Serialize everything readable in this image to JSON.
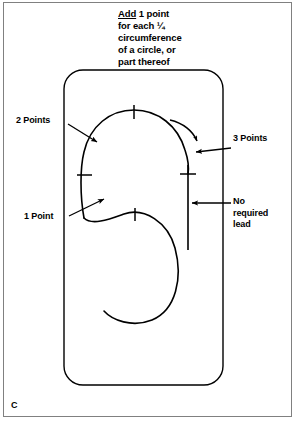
{
  "figure": {
    "panel_letter": "C",
    "note": {
      "line1_underlined": "Add",
      "line1_rest": " 1 point",
      "line2": "for each ¼",
      "line3": "circumference",
      "line4": "of a circle, or",
      "line5": "part thereof",
      "full_text": "Add 1 point for each ¼ circumference of a circle, or part thereof"
    },
    "labels": {
      "two_points": "2 Points",
      "one_point": "1 Point",
      "three_points": "3 Points",
      "no_required_lead": "No\nrequired\nlead"
    },
    "colors": {
      "ink": "#000000",
      "frame": "#808080",
      "background": "#ffffff"
    },
    "icons": {
      "direction_arrow": "curved-arrow-clockwise",
      "pointer_two_points": "arrow-down-right",
      "pointer_one_point": "arrow-up-right",
      "pointer_three_points": "arrow-left",
      "pointer_no_lead": "arrow-left"
    },
    "tick_marks": {
      "count": 4,
      "positions": [
        "top",
        "left",
        "right",
        "bottom"
      ]
    }
  }
}
